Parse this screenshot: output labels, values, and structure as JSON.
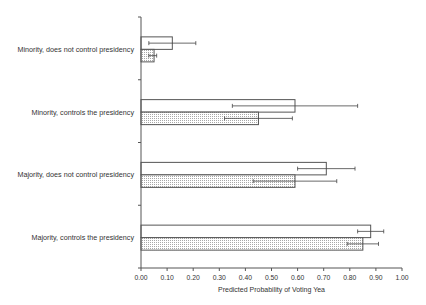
{
  "chart_data": {
    "type": "bar",
    "orientation": "horizontal",
    "title": "",
    "xlabel": "Predicted Probability of Voting Yea",
    "ylabel": "",
    "xlim": [
      0,
      1
    ],
    "x_ticks": [
      "0.00",
      "0.10",
      "0.20",
      "0.30",
      "0.40",
      "0.50",
      "0.60",
      "0.70",
      "0.80",
      "0.90",
      "1.00"
    ],
    "grid": false,
    "legend": null,
    "categories": [
      "Minority, does not control presidency",
      "Minority, controls the presidency",
      "Majority, does not control presidency",
      "Majority, controls the presidency"
    ],
    "series": [
      {
        "name": "Series 1 (white bars)",
        "fill": "white",
        "values": [
          0.12,
          0.59,
          0.71,
          0.88
        ],
        "error_low": [
          0.03,
          0.35,
          0.6,
          0.83
        ],
        "error_high": [
          0.21,
          0.83,
          0.82,
          0.93
        ]
      },
      {
        "name": "Series 2 (dotted bars)",
        "fill": "dotted",
        "values": [
          0.05,
          0.45,
          0.59,
          0.85
        ],
        "error_low": [
          0.03,
          0.32,
          0.43,
          0.79
        ],
        "error_high": [
          0.06,
          0.58,
          0.75,
          0.91
        ]
      }
    ]
  },
  "colors": {
    "axis": "#555555",
    "bar_stroke": "#555555",
    "dot": "#9a9a9a",
    "text": "#333333"
  }
}
